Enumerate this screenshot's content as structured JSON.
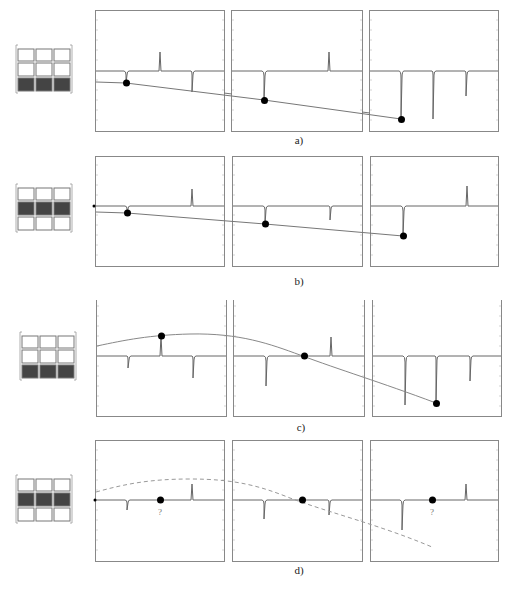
{
  "figure": {
    "rows": [
      {
        "id": "a",
        "caption": "a)",
        "grid_highlight_row": 2,
        "curve_style": "solid",
        "panels": [
          {
            "spikes": [
              {
                "x": 0.25,
                "h": 0.6
              },
              {
                "x": 0.5,
                "h": -0.6
              },
              {
                "x": 0.75,
                "h": 2.0
              }
            ],
            "dot": {
              "x": 0.25,
              "y": 0.38
            }
          },
          {
            "spikes": [
              {
                "x": 0.25,
                "h": 2.9
              },
              {
                "x": 0.75,
                "h": -0.6
              }
            ],
            "dot": {
              "x": 0.25,
              "y": 0.55
            }
          },
          {
            "spikes": [
              {
                "x": 0.25,
                "h": 4.8
              },
              {
                "x": 0.5,
                "h": 4.8
              },
              {
                "x": 0.75,
                "h": 2.5
              }
            ],
            "dot": {
              "x": 0.25,
              "y": 0.73
            }
          }
        ],
        "line_points": [
          [
            0.0,
            0.36
          ],
          [
            1.0,
            0.75
          ]
        ]
      },
      {
        "id": "b",
        "caption": "b)",
        "grid_highlight_row": 1,
        "curve_style": "solid",
        "panels": [
          {
            "spikes": [
              {
                "x": 0.25,
                "h": 0.6
              },
              {
                "x": 0.75,
                "h": -1.6
              }
            ],
            "dot": {
              "x": 0.25,
              "y": 0.37
            }
          },
          {
            "spikes": [
              {
                "x": 0.25,
                "h": 1.8
              },
              {
                "x": 0.75,
                "h": 1.4
              }
            ],
            "dot": {
              "x": 0.25,
              "y": 0.58
            }
          },
          {
            "spikes": [
              {
                "x": 0.25,
                "h": 3.1
              },
              {
                "x": 0.75,
                "h": -1.9
              }
            ],
            "dot": {
              "x": 0.25,
              "y": 0.78
            }
          }
        ],
        "line_points": [
          [
            0.0,
            0.35
          ],
          [
            1.0,
            0.8
          ]
        ]
      },
      {
        "id": "c",
        "caption": "c)",
        "grid_highlight_row": 2,
        "curve_style": "solid",
        "panels": [
          {
            "spikes": [
              {
                "x": 0.25,
                "h": 1.2
              },
              {
                "x": 0.5,
                "h": -2.0
              },
              {
                "x": 0.75,
                "h": 2.1
              }
            ],
            "dot": {
              "x": 0.5,
              "y": 0.38
            }
          },
          {
            "spikes": [
              {
                "x": 0.25,
                "h": 3.0
              },
              {
                "x": 0.75,
                "h": -1.9
              }
            ],
            "dot": {
              "x": 0.55,
              "y": 0.5
            }
          },
          {
            "spikes": [
              {
                "x": 0.25,
                "h": 4.9
              },
              {
                "x": 0.5,
                "h": 4.6
              },
              {
                "x": 0.75,
                "h": 2.5
              }
            ],
            "dot": {
              "x": 0.5,
              "y": 0.8
            }
          }
        ],
        "line_points": "curve"
      },
      {
        "id": "d",
        "caption": "d)",
        "grid_highlight_row": 1,
        "curve_style": "dashed",
        "panels": [
          {
            "spikes": [
              {
                "x": 0.25,
                "h": 0.9
              },
              {
                "x": 0.75,
                "h": -1.7
              }
            ],
            "dot": {
              "x": 0.5,
              "y": 0.5
            },
            "label": "?"
          },
          {
            "spikes": [
              {
                "x": 0.25,
                "h": 1.8
              },
              {
                "x": 0.75,
                "h": 1.3
              }
            ],
            "dot": {
              "x": 0.55,
              "y": 0.5
            }
          },
          {
            "spikes": [
              {
                "x": 0.25,
                "h": 3.0
              },
              {
                "x": 0.75,
                "h": -1.9
              }
            ],
            "dot": {
              "x": 0.5,
              "y": 0.5
            },
            "label": "?"
          }
        ],
        "line_points": "curve"
      }
    ],
    "question_mark": "?"
  }
}
